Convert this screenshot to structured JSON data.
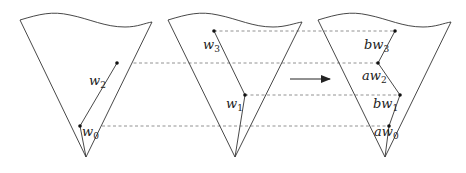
{
  "diagram": {
    "colors": {
      "stroke": "#333333",
      "dashed": "#777777",
      "background": "#ffffff"
    },
    "cones": [
      {
        "id": "cone-left",
        "points": [
          {
            "name": "w2",
            "base": "w",
            "sub": "2",
            "prefix": "",
            "x": 117,
            "y": 63
          },
          {
            "name": "w0",
            "base": "w",
            "sub": "0",
            "prefix": "",
            "x": 80,
            "y": 126
          }
        ]
      },
      {
        "id": "cone-middle",
        "points": [
          {
            "name": "w3",
            "base": "w",
            "sub": "3",
            "prefix": "",
            "x": 214,
            "y": 31
          },
          {
            "name": "w1",
            "base": "w",
            "sub": "1",
            "prefix": "",
            "x": 245,
            "y": 95
          }
        ]
      },
      {
        "id": "cone-right",
        "points": [
          {
            "name": "bw3",
            "base": "w",
            "sub": "3",
            "prefix": "b",
            "x": 395,
            "y": 31
          },
          {
            "name": "aw2",
            "base": "w",
            "sub": "2",
            "prefix": "a",
            "x": 378,
            "y": 63
          },
          {
            "name": "bw1",
            "base": "w",
            "sub": "1",
            "prefix": "b",
            "x": 400,
            "y": 95
          },
          {
            "name": "aw0",
            "base": "w",
            "sub": "0",
            "prefix": "a",
            "x": 389,
            "y": 126
          }
        ]
      }
    ],
    "labels": {
      "w2": {
        "prefix": "",
        "base": "w",
        "sub": "2"
      },
      "w0": {
        "prefix": "",
        "base": "w",
        "sub": "0"
      },
      "w3": {
        "prefix": "",
        "base": "w",
        "sub": "3"
      },
      "w1": {
        "prefix": "",
        "base": "w",
        "sub": "1"
      },
      "bw3": {
        "prefix": "b",
        "base": "w",
        "sub": "3"
      },
      "aw2": {
        "prefix": "a",
        "base": "w",
        "sub": "2"
      },
      "bw1": {
        "prefix": "b",
        "base": "w",
        "sub": "1"
      },
      "aw0": {
        "prefix": "a",
        "base": "w",
        "sub": "0"
      }
    },
    "arrow": {
      "from_x": 290,
      "to_x": 330,
      "y": 79,
      "direction": "right"
    }
  }
}
